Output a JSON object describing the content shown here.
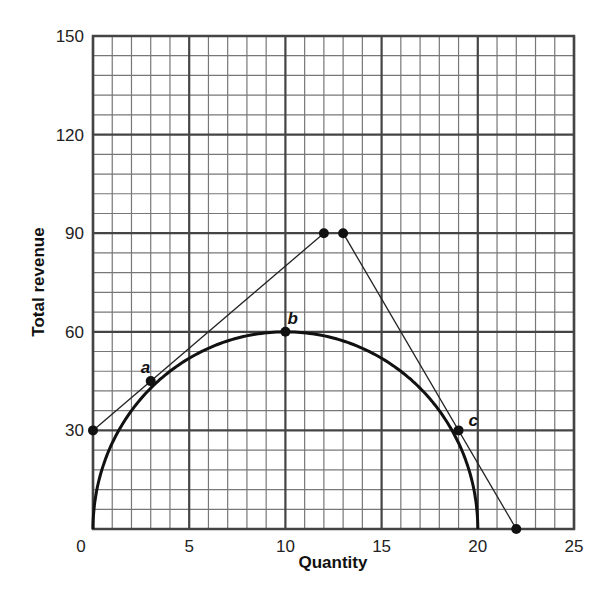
{
  "chart_data": {
    "type": "line",
    "title": "",
    "xlabel": "Quantity",
    "ylabel": "Total revenue",
    "xlim": [
      0,
      25
    ],
    "ylim": [
      0,
      150
    ],
    "x_ticks": [
      0,
      5,
      10,
      15,
      20,
      25
    ],
    "y_ticks": [
      30,
      60,
      90,
      120,
      150
    ],
    "x_tick_labels": [
      "0",
      "5",
      "10",
      "15",
      "20",
      "25"
    ],
    "y_tick_labels": [
      "30",
      "60",
      "90",
      "120",
      "150"
    ],
    "grid": {
      "on": true,
      "x_minor_step": 1,
      "y_minor_step": 6,
      "x_major_step": 5,
      "y_major_step": 30
    },
    "legend": null,
    "series": [
      {
        "name": "Total revenue curve",
        "kind": "curve",
        "description": "Concave total revenue curve from (0,0) peaking at (10,60) and returning to (20,0)",
        "x": [
          0,
          0.5,
          1,
          2,
          3,
          4,
          5,
          6,
          7,
          8,
          9,
          10,
          11,
          12,
          13,
          14,
          15,
          16,
          17,
          18,
          19,
          19.5,
          20
        ],
        "y": [
          0,
          18.7,
          26.2,
          36,
          42.8,
          48,
          52,
          55,
          57.2,
          58.8,
          59.7,
          60,
          59.7,
          58.8,
          57.2,
          55,
          52,
          48,
          42.8,
          36,
          26.2,
          18.7,
          0
        ]
      },
      {
        "name": "Tangent at a",
        "kind": "line",
        "x": [
          0,
          12
        ],
        "y": [
          30,
          90
        ]
      },
      {
        "name": "Tangent at c",
        "kind": "line",
        "x": [
          13,
          22
        ],
        "y": [
          90,
          0
        ]
      }
    ],
    "points": [
      {
        "label": "",
        "x": 0,
        "y": 30
      },
      {
        "label": "a",
        "x": 3,
        "y": 45
      },
      {
        "label": "b",
        "x": 10,
        "y": 60
      },
      {
        "label": "",
        "x": 12,
        "y": 90
      },
      {
        "label": "",
        "x": 13,
        "y": 90
      },
      {
        "label": "c",
        "x": 19,
        "y": 30
      },
      {
        "label": "",
        "x": 22,
        "y": 0
      }
    ],
    "annotations": [
      "a",
      "b",
      "c"
    ]
  }
}
